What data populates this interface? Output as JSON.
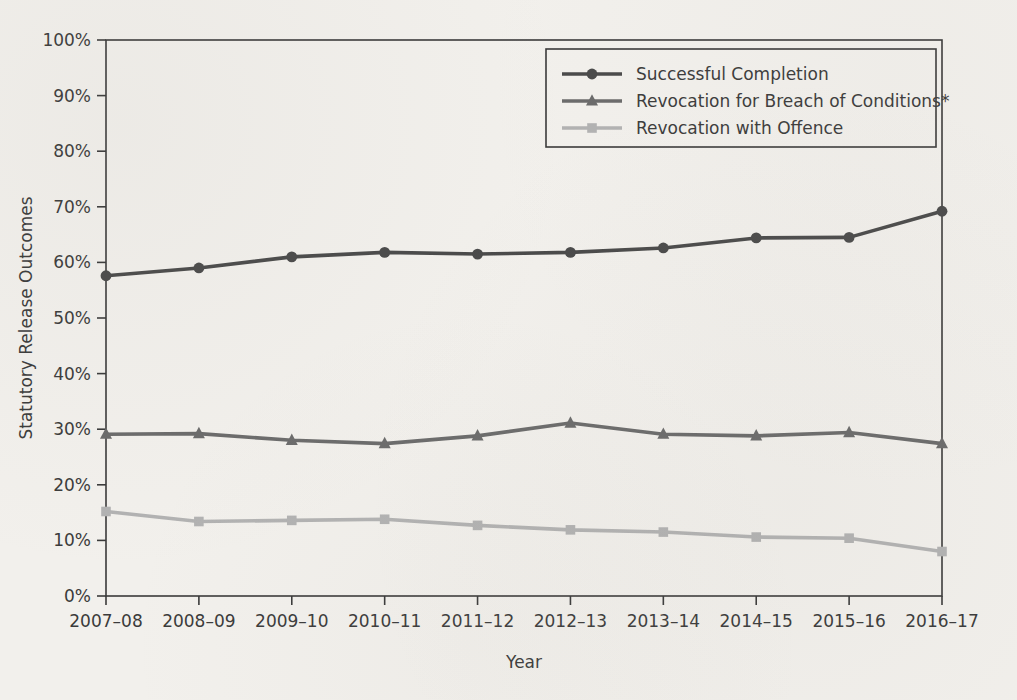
{
  "chart_data": {
    "type": "line",
    "title": "",
    "xlabel": "Year",
    "ylabel": "Statutory Release Outcomes",
    "categories": [
      "2007–08",
      "2008–09",
      "2009–10",
      "2010–11",
      "2011–12",
      "2012–13",
      "2013–14",
      "2014–15",
      "2015–16",
      "2016–17"
    ],
    "ylim": [
      0,
      100
    ],
    "ytick_labels": [
      "0%",
      "10%",
      "20%",
      "30%",
      "40%",
      "50%",
      "60%",
      "70%",
      "80%",
      "90%",
      "100%"
    ],
    "ytick_values": [
      0,
      10,
      20,
      30,
      40,
      50,
      60,
      70,
      80,
      90,
      100
    ],
    "grid": false,
    "legend_position": "top-center",
    "series": [
      {
        "name": "Successful Completion",
        "marker": "circle",
        "color": "#4a4a4a",
        "values": [
          57.6,
          59.0,
          61.0,
          61.8,
          61.5,
          61.8,
          62.6,
          64.4,
          64.5,
          69.2
        ]
      },
      {
        "name": "Revocation for Breach of Conditions*",
        "marker": "triangle",
        "color": "#6b6b6b",
        "values": [
          29.1,
          29.2,
          28.0,
          27.4,
          28.8,
          31.1,
          29.1,
          28.8,
          29.4,
          27.4
        ]
      },
      {
        "name": "Revocation with Offence",
        "marker": "square",
        "color": "#b2b2b2",
        "values": [
          15.2,
          13.4,
          13.6,
          13.8,
          12.7,
          11.9,
          11.5,
          10.6,
          10.4,
          8.0
        ]
      }
    ]
  },
  "colors": {
    "background": "#f2f0ec",
    "axis": "#3a3a3a",
    "series_dark": "#4a4a4a",
    "series_medium": "#6b6b6b",
    "series_light": "#b2b2b2"
  }
}
